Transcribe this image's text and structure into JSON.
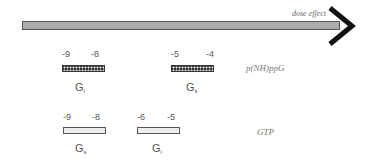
{
  "axis": {
    "label": "dose effect",
    "direction": "right"
  },
  "rows": [
    {
      "ligand": "p(NH)ppG",
      "bar_style": "dark-zigzag",
      "ranges": [
        {
          "protein": "G",
          "subscript": "i",
          "from": "-9",
          "to": "-8"
        },
        {
          "protein": "G",
          "subscript": "s",
          "from": "-5",
          "to": "-4"
        }
      ]
    },
    {
      "ligand": "GTP",
      "bar_style": "light-dotted",
      "ranges": [
        {
          "protein": "G",
          "subscript": "s",
          "from": "-9",
          "to": "-8"
        },
        {
          "protein": "G",
          "subscript": "i",
          "from": "-6",
          "to": "-5"
        }
      ]
    }
  ],
  "colors": {
    "arrow_outline": "#555555",
    "arrow_head": "#111111",
    "text": "#555555"
  }
}
